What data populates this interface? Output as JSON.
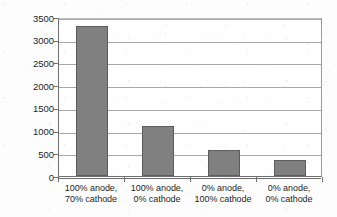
{
  "chart_data": {
    "type": "bar",
    "title": "",
    "subtitle": "",
    "xlabel": "",
    "ylabel": "Operating hours",
    "ylim": [
      0,
      3500
    ],
    "ytick_step": 500,
    "ytick_labels": [
      "3500",
      "3000",
      "2500",
      "2000",
      "1500",
      "1000",
      "500",
      "0"
    ],
    "ytick_values": [
      3500,
      3000,
      2500,
      2000,
      1500,
      1000,
      500,
      0
    ],
    "grid": "horizontal",
    "legend": "none",
    "categories": [
      "100% anode, 70% cathode",
      "100% anode, 0% cathode",
      "0% anode, 100% cathode",
      "0% anode, 0% cathode"
    ],
    "category_lines": [
      [
        "100% anode,",
        "70% cathode"
      ],
      [
        "100% anode,",
        "0% cathode"
      ],
      [
        "0% anode,",
        "100% cathode"
      ],
      [
        "0% anode,",
        "0% cathode"
      ]
    ],
    "values": [
      3300,
      1100,
      580,
      350
    ],
    "series": [
      {
        "name": "Operating hours",
        "values": [
          3300,
          1100,
          580,
          350
        ]
      }
    ]
  },
  "style": {
    "bar_fill": "#808080",
    "bar_border": "#5c5c5c",
    "gridline_color": "#a9a9a9",
    "axis_color": "#6f6f6f",
    "plot_background": "#fefefe",
    "page_background": "#fdfdfd",
    "text_color": "#1f1f1f"
  }
}
